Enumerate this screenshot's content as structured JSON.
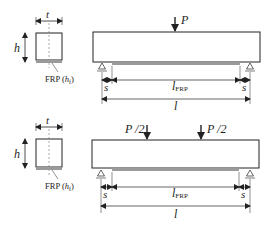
{
  "diagrams": [
    {
      "name": "three-point-bending",
      "load_labels": [
        "P"
      ],
      "section": {
        "width_label": "t",
        "height_label": "h",
        "frp_label": "FRP (",
        "frp_sym": "h",
        "frp_sub": "f",
        "frp_close": ")"
      },
      "dims": {
        "s_left": "s",
        "s_right": "s",
        "frp_len": "l",
        "frp_len_sub": "FRP",
        "span": "l"
      }
    },
    {
      "name": "four-point-bending",
      "load_labels": [
        "P /2",
        "P /2"
      ],
      "section": {
        "width_label": "t",
        "height_label": "h",
        "frp_label": "FRP (",
        "frp_sym": "h",
        "frp_sub": "f",
        "frp_close": ")"
      },
      "dims": {
        "s_left": "s",
        "s_right": "s",
        "frp_len": "l",
        "frp_len_sub": "FRP",
        "span": "l"
      }
    }
  ],
  "colors": {
    "line": "#222222",
    "frp": "#9a9a9a",
    "dash": "#777777"
  }
}
